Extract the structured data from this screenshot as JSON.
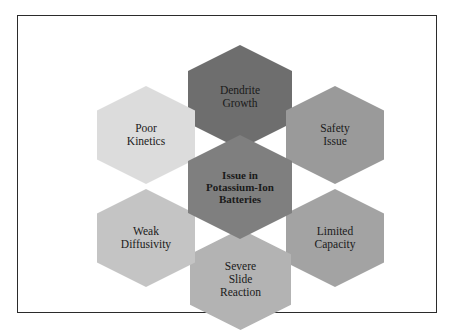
{
  "diagram": {
    "type": "hexagon-cluster",
    "frame": {
      "border_color": "#2b2b2b",
      "background": "#ffffff"
    },
    "center": {
      "label": "Issue in Potassium-Ion Batteries",
      "lines": [
        "Issue in",
        "Potassium-Ion",
        "Batteries"
      ],
      "color": "#7f7f7f",
      "name": "center-node"
    },
    "nodes": [
      {
        "label": "Dendrite Growth",
        "lines": [
          "Dendrite",
          "Growth"
        ],
        "color": "#6e6e6e",
        "name": "node-dendrite-growth"
      },
      {
        "label": "Safety Issue",
        "lines": [
          "Safety",
          "Issue"
        ],
        "color": "#9a9a9a",
        "name": "node-safety-issue"
      },
      {
        "label": "Limited Capacity",
        "lines": [
          "Limited",
          "Capacity"
        ],
        "color": "#a3a3a3",
        "name": "node-limited-capacity"
      },
      {
        "label": "Severe Slide Reaction",
        "lines": [
          "Severe",
          "Slide",
          "Reaction"
        ],
        "color": "#b3b3b3",
        "name": "node-severe-slide-reaction"
      },
      {
        "label": "Weak Diffusivity",
        "lines": [
          "Weak",
          "Diffusivity"
        ],
        "color": "#c4c4c4",
        "name": "node-weak-diffusivity"
      },
      {
        "label": "Poor Kinetics",
        "lines": [
          "Poor",
          "Kinetics"
        ],
        "color": "#dcdcdc",
        "name": "node-poor-kinetics"
      }
    ]
  }
}
